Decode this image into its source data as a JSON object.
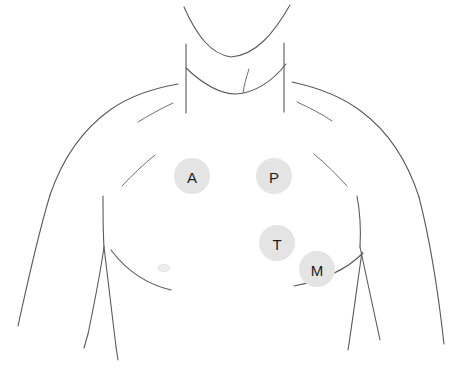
{
  "diagram": {
    "background_color": "#ffffff",
    "outline_color": "#5a5a5a",
    "marker_fill_color": "#e4e4e4",
    "marker_label_color": "#1c1c1c",
    "nipple_mark_color": "#efefef"
  },
  "markers": [
    {
      "id": "aortic",
      "label": "A",
      "name": "aortic-area-marker",
      "cx": 192,
      "cy": 176,
      "r": 18
    },
    {
      "id": "pulmonic",
      "label": "P",
      "name": "pulmonic-area-marker",
      "cx": 274,
      "cy": 176,
      "r": 18
    },
    {
      "id": "tricuspid",
      "label": "T",
      "name": "tricuspid-area-marker",
      "cx": 277,
      "cy": 243,
      "r": 18
    },
    {
      "id": "mitral",
      "label": "M",
      "name": "mitral-area-marker",
      "cx": 317,
      "cy": 269,
      "r": 18
    }
  ],
  "anatomy_paths": {
    "jaw_curve": "M 184 7 C 196 34 210 54 231 57 C 256 55 274 33 290 5",
    "neck_left": "M 186 44 L 186 113",
    "neck_right": "M 284 43 L 284 112",
    "clavicle_notch": "M 186 68 C 205 86 222 94 236 94 C 254 93 272 82 286 64",
    "sternum_short": "M 249 69 C 246 78 244 86 243 93",
    "shoulder_left": "M 178 84 C 150 89 128 97 110 110 C 82 130 62 160 50 195",
    "shoulder_right": "M 292 82 C 320 88 344 98 362 112 C 390 133 408 163 419 197",
    "arm_left": "M 50 195 C 38 235 28 280 18 326",
    "arm_right": "M 419 197 C 430 240 438 290 444 344",
    "clavicle_line_left": "M 173 103 C 160 109 148 116 138 122",
    "clavicle_line_right": "M 297 102 C 310 108 322 114 332 121",
    "pectoral_crease_left": "M 155 155 C 143 165 132 175 122 186",
    "pectoral_crease_right": "M 314 154 C 326 164 337 175 347 186",
    "armpit_left": "M 103 196 C 103 215 103 232 104 247",
    "armpit_right": "M 357 196 C 360 212 361 230 360 247",
    "torso_side_left": "M 104 247 C 100 275 94 305 88 334",
    "torso_side_right": "M 360 247 C 366 276 373 308 380 340",
    "hip_left": "M 104 247 C 108 282 112 315 116 347",
    "hip_right": "M 362 252 C 357 286 353 318 348 350",
    "waist_left": "M 88 334 L 84 348",
    "costal_margin_left": "M 111 250 C 126 270 146 284 171 290",
    "costal_margin_right": "M 363 253 C 348 268 325 280 294 286",
    "midline_left": "M 103 196 L 103 247",
    "leg_line_left": "M 116 347 L 118 360"
  },
  "nipple_mark": {
    "name": "nipple-mark-left",
    "cx": 164,
    "cy": 268,
    "rx": 6,
    "ry": 3.5
  }
}
